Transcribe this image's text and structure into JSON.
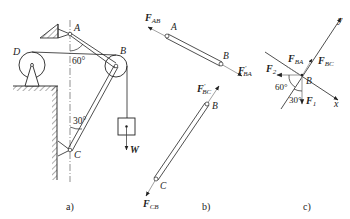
{
  "figure": {
    "panels": [
      {
        "caption": "a)",
        "points": {
          "A": "A",
          "B": "B",
          "C": "C",
          "D": "D"
        },
        "angles": {
          "top": "60°",
          "bottom": "30°"
        },
        "load": "W"
      },
      {
        "caption": "b)",
        "points": {
          "A": "A",
          "B_top": "B",
          "B_bottom": "B",
          "C": "C"
        },
        "forces": {
          "F_AB": {
            "main": "F",
            "sub": "AB",
            "prime": ""
          },
          "F_BA_prime": {
            "main": "F",
            "sub": "BA",
            "prime": "′"
          },
          "F_BC_prime": {
            "main": "F",
            "sub": "BC",
            "prime": "′"
          },
          "F_CB": {
            "main": "F",
            "sub": "CB",
            "prime": ""
          }
        }
      },
      {
        "caption": "c)",
        "points": {
          "B": "B"
        },
        "axes": {
          "x": "x",
          "y": "y"
        },
        "angles": {
          "left": "60°",
          "bottom": "30°"
        },
        "forces": {
          "F_BA": {
            "main": "F",
            "sub": "BA"
          },
          "F_BC": {
            "main": "F",
            "sub": "BC"
          },
          "F_1": {
            "main": "F",
            "sub": "1"
          },
          "F_2": {
            "main": "F",
            "sub": "2"
          }
        }
      }
    ],
    "colors": {
      "ink": "#222222",
      "background": "#ffffff"
    }
  }
}
